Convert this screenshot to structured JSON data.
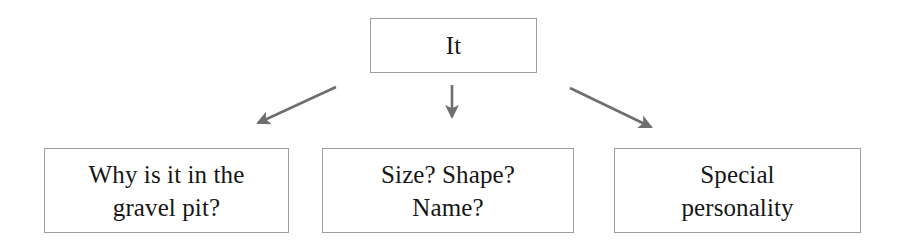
{
  "diagram": {
    "type": "mind-map",
    "orientation": "top-down",
    "background_color": "#ffffff",
    "box_border_color": "#9d9d9d",
    "box_fill_color": "#ffffff",
    "text_color": "#161616",
    "arrow_color": "#6e6e6e",
    "root": {
      "id": "root",
      "label": "It"
    },
    "branches": [
      {
        "id": "reason",
        "label": "Why is it in the\ngravel pit?",
        "arrow": {
          "name": "arrow-root-to-reason",
          "direction": "down-left",
          "from": [
            336,
            87
          ],
          "to": [
            252,
            126
          ]
        }
      },
      {
        "id": "attributes",
        "label": "Size? Shape?\nName?",
        "arrow": {
          "name": "arrow-root-to-attributes",
          "direction": "down",
          "from": [
            452,
            85
          ],
          "to": [
            452,
            124
          ]
        }
      },
      {
        "id": "personality",
        "label": "Special\npersonality",
        "arrow": {
          "name": "arrow-root-to-personality",
          "direction": "down-right",
          "from": [
            570,
            88
          ],
          "to": [
            658,
            131
          ]
        }
      }
    ]
  }
}
